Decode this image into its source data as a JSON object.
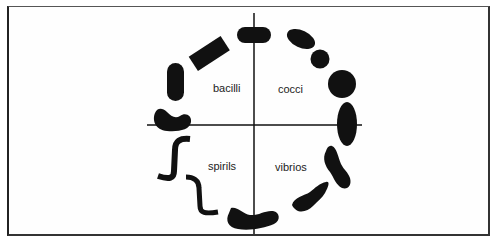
{
  "diagram": {
    "type": "bacterial-morphology-wheel",
    "quadrants": {
      "top_left": {
        "label": "bacilli",
        "shape": "rod-shaped"
      },
      "top_right": {
        "label": "cocci",
        "shape": "spherical"
      },
      "bottom_left": {
        "label": "spirils",
        "shape": "spiral"
      },
      "bottom_right": {
        "label": "vibrios",
        "shape": "comma-shaped"
      }
    },
    "colors": {
      "shape_fill": "#111111",
      "axis": "#111111",
      "frame": "#333333",
      "background": "#ffffff",
      "text": "#222222"
    }
  }
}
